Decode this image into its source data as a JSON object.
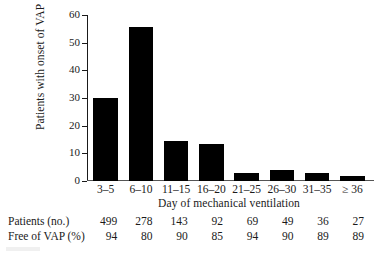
{
  "chart_data": {
    "type": "bar",
    "title": "",
    "subtitle": "",
    "xlabel": "Day of mechanical ventilation",
    "ylabel": "Patients with onset of VAP",
    "categories": [
      "3–5",
      "6–10",
      "11–15",
      "16–20",
      "21–25",
      "26–30",
      "31–35",
      "≥ 36"
    ],
    "values": [
      30,
      55.5,
      14.5,
      13.5,
      3,
      4,
      3,
      1.7
    ],
    "ylim": [
      0,
      60
    ],
    "yticks": [
      0,
      10,
      20,
      30,
      40,
      50,
      60
    ],
    "ytick_labels": [
      "0",
      "10",
      "20",
      "30",
      "40",
      "50",
      "60"
    ],
    "grid": false,
    "legend": false,
    "legend_position": "none",
    "bar_color": "#000000",
    "axis_color": "#1a1a1a",
    "background": "#ffffff",
    "table": {
      "rows": [
        {
          "label": "Patients (no.)",
          "values": [
            "499",
            "278",
            "143",
            "92",
            "69",
            "49",
            "36",
            "27"
          ]
        },
        {
          "label": "Free of VAP (%)",
          "values": [
            "94",
            "80",
            "90",
            "85",
            "94",
            "90",
            "89",
            "89"
          ]
        }
      ]
    }
  }
}
